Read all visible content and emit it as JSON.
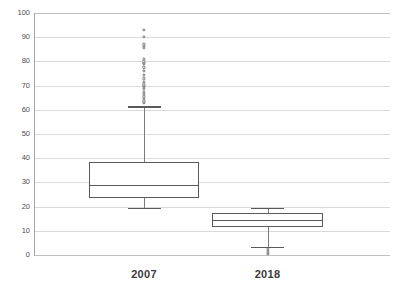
{
  "chart_data": {
    "type": "box",
    "title": "",
    "xlabel": "",
    "ylabel": "",
    "ylim": [
      0,
      100
    ],
    "grid": true,
    "legend": "none",
    "yticks": [
      0,
      10,
      20,
      30,
      40,
      50,
      60,
      70,
      80,
      90,
      100
    ],
    "ytick_labels": [
      "0",
      "10",
      "20",
      "30",
      "40",
      "50",
      "60",
      "70",
      "80",
      "90",
      "100"
    ],
    "categories": [
      "2007",
      "2018"
    ],
    "series": [
      {
        "name": "2007",
        "min_whisker": 19.5,
        "q1": 23.5,
        "median": 29,
        "q3": 38.5,
        "max_whisker": 61.5,
        "outliers": [
          63,
          63.5,
          64.5,
          65.5,
          66.5,
          67.5,
          68.5,
          69.5,
          70,
          70.5,
          71.5,
          73,
          74.5,
          76,
          77.5,
          79,
          79.5,
          80,
          81,
          85.5,
          86.5,
          87,
          90,
          93
        ]
      },
      {
        "name": "2018",
        "min_whisker": 3.5,
        "q1": 11.5,
        "median": 14.5,
        "q3": 17.5,
        "max_whisker": 19.5,
        "outliers": [
          0.3,
          1,
          1.8,
          2.5
        ]
      }
    ]
  },
  "colors": {
    "gridline": "#d9d9d9",
    "axis": "#a6a6a6",
    "box_stroke": "#5a5a5a",
    "whisker": "#7a7a7a",
    "outlier_stroke": "#777777",
    "tick_label": "#4d4d4d",
    "category_label": "#3a3a3a",
    "background": "#ffffff"
  }
}
